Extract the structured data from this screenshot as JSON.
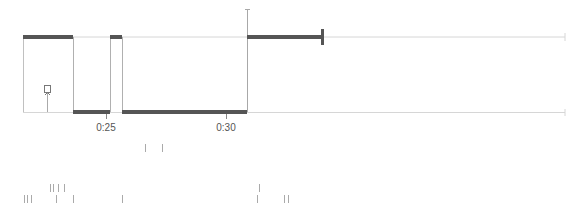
{
  "timeline": {
    "axis_labels": [
      {
        "text": "0:25",
        "x": 106
      },
      {
        "text": "0:30",
        "x": 226
      }
    ],
    "colors": {
      "thick_segment": "#555555",
      "thin_line": "#d0d0d0",
      "edge": "#b0b0b0",
      "label": "#555555",
      "event_tick": "#aaaaaa"
    },
    "levels": {
      "high_y": 37,
      "low_y": 112
    },
    "segments": [
      {
        "level": "high",
        "x1": 23,
        "x2": 73
      },
      {
        "level": "low",
        "x1": 73,
        "x2": 110
      },
      {
        "level": "high",
        "x1": 110,
        "x2": 122
      },
      {
        "level": "low",
        "x1": 122,
        "x2": 247
      },
      {
        "level": "high",
        "x1": 247,
        "x2": 323
      }
    ],
    "marker": {
      "icon": "marker-flag-icon",
      "x": 47
    },
    "end_cap_x": 323,
    "line_end_x": 565
  },
  "event_rows": [
    {
      "y": 148,
      "ticks": [
        145,
        162
      ]
    },
    {
      "y": 188,
      "ticks": [
        50,
        53,
        58,
        64,
        259
      ]
    },
    {
      "y": 199,
      "ticks": [
        24,
        27,
        31,
        56,
        73,
        122,
        257,
        284,
        288
      ]
    }
  ]
}
